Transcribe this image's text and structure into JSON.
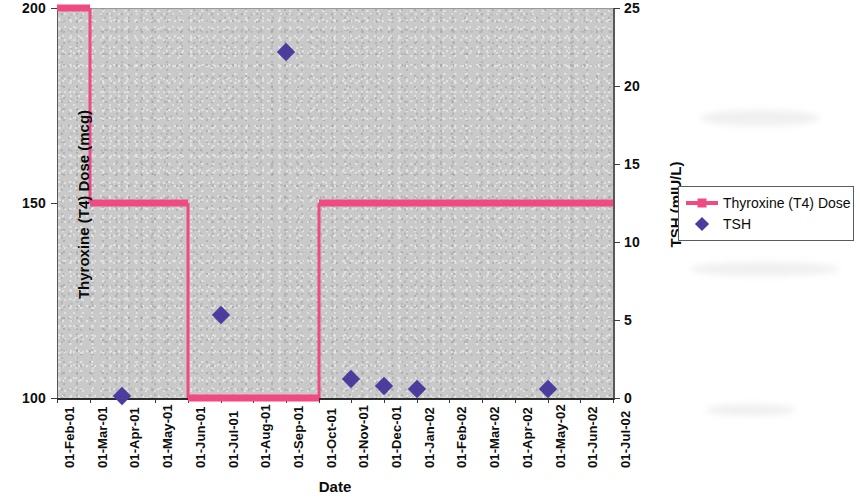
{
  "chart_data": {
    "type": "line",
    "title": "",
    "xlabel": "Date",
    "ylabel": "Thyroxine (T4) Dose (mcg)",
    "y2label": "TSH (mIU/L)",
    "grid": false,
    "legend_position": "right",
    "x_tick_labels": [
      "01-Feb-01",
      "01-Mar-01",
      "01-Apr-01",
      "01-May-01",
      "01-Jun-01",
      "01-Jul-01",
      "01-Aug-01",
      "01-Sep-01",
      "01-Oct-01",
      "01-Nov-01",
      "01-Dec-01",
      "01-Jan-02",
      "01-Feb-02",
      "01-Mar-02",
      "01-Apr-02",
      "01-May-02",
      "01-Jun-02",
      "01-Jul-02"
    ],
    "ylim": [
      100,
      200
    ],
    "y_tick_labels": [
      "100",
      "150",
      "200"
    ],
    "y_ticks": [
      100,
      150,
      200
    ],
    "y2lim": [
      0,
      25
    ],
    "y2_tick_labels": [
      "0",
      "5",
      "10",
      "15",
      "20",
      "25"
    ],
    "y2_ticks": [
      0,
      5,
      10,
      15,
      20,
      25
    ],
    "series": [
      {
        "name": "Thyroxine (T4) Dose",
        "type": "step",
        "axis": "left",
        "color": "#ef4a82",
        "marker": "square",
        "points": [
          {
            "x": "01-Feb-01",
            "y": 200
          },
          {
            "x": "01-Mar-01",
            "y": 200
          },
          {
            "x": "01-Mar-01",
            "y": 150
          },
          {
            "x": "01-Jun-01",
            "y": 150
          },
          {
            "x": "01-Jun-01",
            "y": 100
          },
          {
            "x": "01-Oct-01",
            "y": 100
          },
          {
            "x": "01-Oct-01",
            "y": 150
          },
          {
            "x": "01-Jul-02",
            "y": 150
          }
        ]
      },
      {
        "name": "TSH",
        "type": "scatter",
        "axis": "right",
        "color": "#4b3d9e",
        "marker": "diamond",
        "points": [
          {
            "x": "01-Apr-01",
            "y": 0.1
          },
          {
            "x": "01-Jul-01",
            "y": 5.3
          },
          {
            "x": "01-Sep-01",
            "y": 22.2
          },
          {
            "x": "01-Nov-01",
            "y": 1.2
          },
          {
            "x": "01-Dec-01",
            "y": 0.8
          },
          {
            "x": "01-Jan-02",
            "y": 0.6
          },
          {
            "x": "01-May-02",
            "y": 0.6
          }
        ]
      }
    ],
    "legend_entries": [
      {
        "label": "Thyroxine (T4) Dose",
        "marker": "line-square",
        "color": "#ef4a82"
      },
      {
        "label": "TSH",
        "marker": "diamond",
        "color": "#4b3d9e"
      }
    ]
  }
}
